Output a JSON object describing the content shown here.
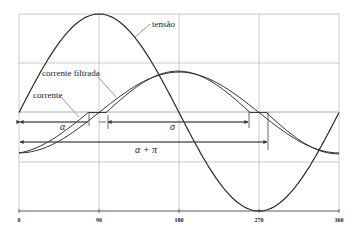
{
  "chart_data": {
    "type": "line",
    "title": "",
    "xlabel": "",
    "ylabel": "",
    "xlim": [
      0,
      360
    ],
    "x_ticks": [
      "0",
      "90",
      "180",
      "270",
      "360"
    ],
    "grid": true,
    "series": [
      {
        "name": "tensão",
        "description": "sine voltage, amplitude 1, sin(x)",
        "x": [
          0,
          90,
          180,
          270,
          360
        ],
        "values": [
          0,
          1,
          0,
          -1,
          0
        ]
      },
      {
        "name": "corrente",
        "description": "rectifier current, zero between ~78° and ~98°, then ~260° to ~278°, peak ~0.41 near 182°, min ~-0.41 at 0/360",
        "x": [
          0,
          78,
          98,
          182,
          260,
          278,
          360
        ],
        "values": [
          -0.41,
          0,
          0,
          0.41,
          0,
          0,
          -0.41
        ]
      },
      {
        "name": "corrente filtrada",
        "description": "smoothed current, crosses zero near 88° and 270°",
        "x": [
          0,
          88,
          182,
          270,
          360
        ],
        "values": [
          -0.4,
          0,
          0.4,
          0,
          -0.4
        ]
      }
    ],
    "annotations": [
      {
        "label": "tensão"
      },
      {
        "label": "corrente filtrada"
      },
      {
        "label": "corrente"
      },
      {
        "label": "α",
        "from_deg": 0,
        "to_deg": 78
      },
      {
        "label": "σ",
        "from_deg": 98,
        "to_deg": 260
      },
      {
        "label": "α + π",
        "from_deg": 0,
        "to_deg": 278
      }
    ]
  },
  "labels": {
    "tensao": "tensão",
    "corrente_filtrada": "corrente filtrada",
    "corrente": "corrente",
    "alpha": "α",
    "sigma": "σ",
    "alpha_pi": "α + π"
  },
  "ticks": {
    "t0": "0",
    "t90": "90",
    "t180": "180",
    "t270": "270",
    "t360": "360"
  },
  "colors": {
    "curve": "#2a2a2a",
    "grid": "#b8b8b8",
    "axis": "#555555"
  }
}
